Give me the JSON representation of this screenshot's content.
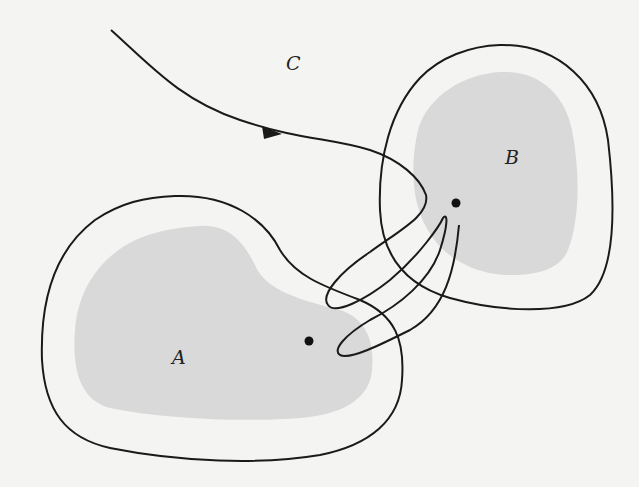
{
  "diagram": {
    "type": "trajectory-through-regions",
    "labels": {
      "A": "A",
      "B": "B",
      "C": "C"
    },
    "regions": [
      {
        "name": "A",
        "description": "shaded inner region with enclosing outer boundary (lower left)",
        "fill": "#d9d9d9"
      },
      {
        "name": "B",
        "description": "shaded inner region with enclosing outer boundary (upper right)",
        "fill": "#d9d9d9"
      }
    ],
    "points": [
      {
        "region": "A",
        "x": 309,
        "y": 341
      },
      {
        "region": "B",
        "x": 456,
        "y": 203
      }
    ],
    "curve": {
      "name": "C",
      "description": "directed trajectory entering from upper left, looping back and forth between neighborhoods of A and B",
      "arrow_direction": "right"
    },
    "colors": {
      "stroke": "#1a1a1a",
      "shade": "#d9d9d9",
      "background": "#f4f4f2"
    }
  }
}
